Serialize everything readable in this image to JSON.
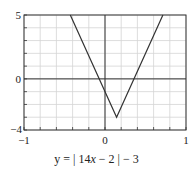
{
  "chart_data": {
    "type": "line",
    "title": "",
    "caption": "y = | 14x − 2 | − 3",
    "function": "y = |14x - 2| - 3",
    "xlabel": "",
    "ylabel": "",
    "xlim": [
      -1,
      1
    ],
    "ylim": [
      -4,
      5
    ],
    "x_tick_labels": [
      "−1",
      "0",
      "1"
    ],
    "y_tick_labels": [
      "5",
      "0",
      "−4"
    ],
    "x_grid_step": 0.2,
    "y_grid_step": 1,
    "grid": true,
    "legend": null,
    "series": [
      {
        "name": "y = |14x − 2| − 3",
        "x": [
          -0.4286,
          0.1429,
          0.7143
        ],
        "y": [
          5,
          -3,
          5
        ]
      }
    ],
    "annotations": {
      "vertex": [
        0.1429,
        -3
      ],
      "x_intercepts": [
        -0.0714,
        0.3571
      ],
      "y_intercept": -1
    }
  },
  "labels": {
    "y_top": "5",
    "y_zero": "0",
    "y_bottom": "−4",
    "x_left": "−1",
    "x_zero": "0",
    "x_right": "1"
  },
  "caption": {
    "prefix": "y = | 14",
    "var": "x",
    "suffix": " − 2 | − 3"
  }
}
